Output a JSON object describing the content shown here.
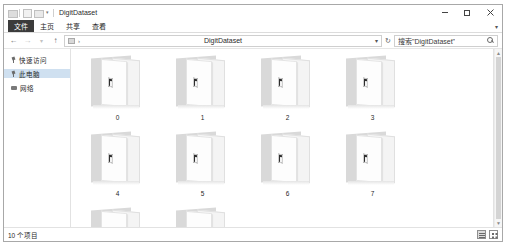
{
  "window": {
    "title": "DigitDataset",
    "quick_access_icons": [
      "explorer-icon",
      "properties-icon",
      "new-folder-icon"
    ],
    "controls": {
      "minimize": "minimize-icon",
      "maximize": "maximize-icon",
      "close": "close-icon"
    }
  },
  "ribbon": {
    "tabs": [
      {
        "label": "文件",
        "selected": true
      },
      {
        "label": "主页",
        "selected": false
      },
      {
        "label": "共享",
        "selected": false
      },
      {
        "label": "查看",
        "selected": false
      }
    ]
  },
  "addressbar": {
    "back": "back-arrow-icon",
    "forward": "forward-arrow-icon",
    "recent": "recent-chevron-icon",
    "up": "up-arrow-icon",
    "path_value": "DigitDataset",
    "path_caret": "chevron-down-icon",
    "refresh": "refresh-icon",
    "search_value": "搜索\"DigitDataset\"",
    "search_icon": "search-icon"
  },
  "sidebar": {
    "items": [
      {
        "label": "快速访问",
        "icon": "pin-icon",
        "selected": false
      },
      {
        "label": "此电脑",
        "icon": "pin-icon",
        "selected": true
      },
      {
        "label": "网络",
        "icon": "network-icon",
        "selected": false
      }
    ]
  },
  "main": {
    "folders": [
      {
        "label": "0"
      },
      {
        "label": "1"
      },
      {
        "label": "2"
      },
      {
        "label": "3"
      },
      {
        "label": "4"
      },
      {
        "label": "5"
      },
      {
        "label": "6"
      },
      {
        "label": "7"
      },
      {
        "label": "8"
      },
      {
        "label": "9"
      }
    ]
  },
  "statusbar": {
    "item_count": "10 个项目",
    "views": [
      {
        "name": "details-view-toggle",
        "active": true
      },
      {
        "name": "large-icons-view-toggle",
        "active": false
      }
    ]
  },
  "colors": {
    "selection": "#cfe0f0",
    "file_tab": "#3b3b3b",
    "close_red": "#e81123"
  }
}
